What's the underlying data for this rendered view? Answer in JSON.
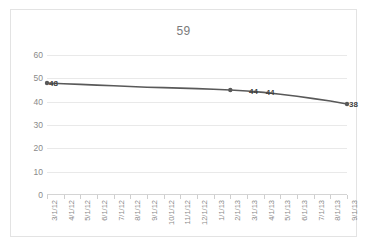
{
  "chart_data": {
    "type": "line",
    "title": "59",
    "xlabel": "",
    "ylabel": "",
    "ylim": [
      0,
      60
    ],
    "yticks": [
      0,
      10,
      20,
      30,
      40,
      50,
      60
    ],
    "grid": true,
    "legend": "none",
    "categories": [
      "3/1/12",
      "4/1/12",
      "5/1/12",
      "6/1/12",
      "7/1/12",
      "8/1/12",
      "9/1/12",
      "10/1/12",
      "11/1/12",
      "12/1/12",
      "1/1/13",
      "2/1/13",
      "3/1/13",
      "4/1/13",
      "5/1/13",
      "6/1/13",
      "7/1/13",
      "8/1/13",
      "9/1/13"
    ],
    "values": [
      48,
      47.7,
      47.4,
      47.1,
      46.8,
      46.5,
      46.2,
      46.0,
      45.8,
      45.6,
      45.3,
      45,
      44.6,
      44,
      43.2,
      42.3,
      41.3,
      40.3,
      39
    ],
    "series_color": "#595959",
    "gridline_color": "#e9e9e9",
    "text_color": "#8a8a8a",
    "point_labels": [
      {
        "text": "48",
        "index": 0,
        "value": 48
      },
      {
        "text": "44",
        "index": 12,
        "value": 44.6
      },
      {
        "text": "44",
        "index": 13,
        "value": 44
      },
      {
        "text": "38",
        "index": 18,
        "value": 39
      }
    ],
    "markers": [
      {
        "index": 0,
        "value": 48
      },
      {
        "index": 11,
        "value": 45
      },
      {
        "index": 18,
        "value": 39
      }
    ]
  }
}
